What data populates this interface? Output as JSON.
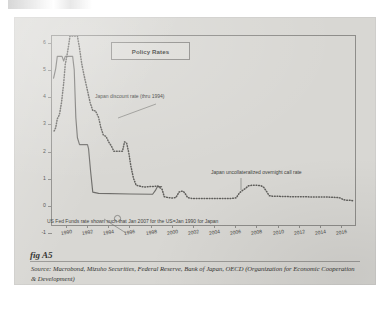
{
  "figure": {
    "label": "fig A5",
    "source_prefix": "Source:",
    "source_text": "Macrobond, Mizuho Securities, Federal Reserve, Bank of Japan, OECD (Organization for Economic Cooperation & Development)"
  },
  "chart_data": {
    "type": "line",
    "title": "Policy Rates",
    "xlabel": "",
    "ylabel": "",
    "grid": false,
    "legend_position": "top-center-box",
    "xlim": [
      1988.6,
      2017.4
    ],
    "ylim": [
      -1,
      6
    ],
    "yticks": [
      6,
      5,
      4,
      3,
      2,
      1,
      0,
      -1
    ],
    "xticks": [
      1990,
      1992,
      1994,
      1996,
      1998,
      2000,
      2002,
      2004,
      2006,
      2008,
      2010,
      2012,
      2014,
      2016
    ],
    "xticklabels": [
      "1990",
      "1992",
      "1994",
      "1996",
      "1998",
      "2000",
      "2002",
      "2004",
      "2006",
      "2008",
      "2010",
      "2012",
      "2014",
      "2016"
    ],
    "yticklabels": [
      "6",
      "5",
      "4",
      "4",
      "3",
      "2",
      "1",
      "0",
      "-1"
    ],
    "annotations": [
      {
        "text": "Japan discount rate (thru 1994)",
        "x": 1993.2,
        "y": 3.95
      },
      {
        "text": "Japan uncollateralized overnight call rate",
        "x": 2005.0,
        "y": 1.0
      },
      {
        "text": "US Fed Funds rate shown such that Jan 2007 for the US=Jan 1990 for Japan",
        "x": 1989.6,
        "y": -0.55
      }
    ],
    "series": [
      {
        "name": "US Fed Funds rate (shifted: Jan 2007 = Jan 1990)",
        "style": "solid",
        "color": "#6f6e6b",
        "points": [
          [
            1988.75,
            4.45
          ],
          [
            1988.95,
            4.8
          ],
          [
            1989.1,
            5.25
          ],
          [
            1989.55,
            5.25
          ],
          [
            1989.7,
            5.08
          ],
          [
            1989.85,
            5.25
          ],
          [
            1990.55,
            5.25
          ],
          [
            1990.7,
            4.75
          ],
          [
            1990.85,
            3.0
          ],
          [
            1991.0,
            2.25
          ],
          [
            1991.2,
            2.0
          ],
          [
            1991.95,
            2.0
          ],
          [
            1992.05,
            1.85
          ],
          [
            1992.25,
            1.0
          ],
          [
            1992.45,
            0.25
          ],
          [
            1993.0,
            0.2
          ],
          [
            1996.0,
            0.18
          ],
          [
            1998.1,
            0.17
          ],
          [
            1998.35,
            0.3
          ],
          [
            1998.55,
            0.45
          ],
          [
            1998.95,
            0.45
          ]
        ]
      },
      {
        "name": "Japan discount rate (thru 1994) / uncollateralized overnight call rate",
        "style": "dotted",
        "color": "#5f5e5b",
        "points": [
          [
            1988.8,
            2.5
          ],
          [
            1988.95,
            2.62
          ],
          [
            1989.1,
            2.95
          ],
          [
            1989.3,
            3.1
          ],
          [
            1989.5,
            3.55
          ],
          [
            1989.7,
            4.25
          ],
          [
            1989.85,
            4.95
          ],
          [
            1990.0,
            5.25
          ],
          [
            1990.15,
            5.6
          ],
          [
            1990.3,
            6.0
          ],
          [
            1990.6,
            6.0
          ],
          [
            1990.8,
            6.0
          ],
          [
            1991.0,
            6.0
          ],
          [
            1991.2,
            5.55
          ],
          [
            1991.4,
            5.0
          ],
          [
            1991.6,
            4.6
          ],
          [
            1991.8,
            4.25
          ],
          [
            1992.0,
            3.9
          ],
          [
            1992.2,
            3.55
          ],
          [
            1992.45,
            3.25
          ],
          [
            1992.7,
            3.25
          ],
          [
            1993.0,
            3.0
          ],
          [
            1993.2,
            2.65
          ],
          [
            1993.45,
            2.35
          ],
          [
            1993.7,
            2.3
          ],
          [
            1993.95,
            2.1
          ],
          [
            1994.2,
            1.95
          ],
          [
            1994.45,
            1.75
          ],
          [
            1994.75,
            1.75
          ],
          [
            1995.05,
            1.75
          ],
          [
            1995.25,
            1.75
          ],
          [
            1995.45,
            2.1
          ],
          [
            1995.65,
            2.05
          ],
          [
            1995.85,
            1.7
          ],
          [
            1996.05,
            1.2
          ],
          [
            1996.3,
            0.75
          ],
          [
            1996.55,
            0.5
          ],
          [
            1996.8,
            0.48
          ],
          [
            1997.05,
            0.45
          ],
          [
            1997.4,
            0.44
          ],
          [
            1997.8,
            0.45
          ],
          [
            1998.2,
            0.46
          ],
          [
            1998.6,
            0.47
          ],
          [
            1999.0,
            0.35
          ],
          [
            1999.2,
            0.08
          ],
          [
            1999.55,
            0.05
          ],
          [
            1999.95,
            0.03
          ],
          [
            2000.3,
            0.05
          ],
          [
            2000.6,
            0.25
          ],
          [
            2000.8,
            0.28
          ],
          [
            2001.0,
            0.28
          ],
          [
            2001.2,
            0.18
          ],
          [
            2001.4,
            0.05
          ],
          [
            2001.7,
            0.02
          ],
          [
            2002.1,
            0.01
          ],
          [
            2002.6,
            0.01
          ],
          [
            2003.1,
            0.01
          ],
          [
            2003.6,
            0.01
          ],
          [
            2004.1,
            0.01
          ],
          [
            2004.6,
            0.01
          ],
          [
            2005.1,
            0.01
          ],
          [
            2005.6,
            0.02
          ],
          [
            2006.0,
            0.04
          ],
          [
            2006.3,
            0.22
          ],
          [
            2006.55,
            0.3
          ],
          [
            2006.85,
            0.38
          ],
          [
            2007.15,
            0.48
          ],
          [
            2007.45,
            0.5
          ],
          [
            2007.75,
            0.5
          ],
          [
            2008.05,
            0.5
          ],
          [
            2008.35,
            0.48
          ],
          [
            2008.6,
            0.42
          ],
          [
            2008.85,
            0.28
          ],
          [
            2009.1,
            0.12
          ],
          [
            2009.4,
            0.1
          ],
          [
            2009.8,
            0.1
          ],
          [
            2010.2,
            0.09
          ],
          [
            2010.6,
            0.09
          ],
          [
            2011.0,
            0.08
          ],
          [
            2011.5,
            0.08
          ],
          [
            2012.0,
            0.08
          ],
          [
            2012.5,
            0.08
          ],
          [
            2013.0,
            0.07
          ],
          [
            2013.5,
            0.07
          ],
          [
            2014.0,
            0.07
          ],
          [
            2014.5,
            0.07
          ],
          [
            2015.0,
            0.06
          ],
          [
            2015.5,
            0.05
          ],
          [
            2015.85,
            0.03
          ],
          [
            2016.1,
            -0.03
          ],
          [
            2016.4,
            -0.05
          ],
          [
            2016.7,
            -0.05
          ],
          [
            2017.0,
            -0.07
          ]
        ]
      }
    ]
  }
}
